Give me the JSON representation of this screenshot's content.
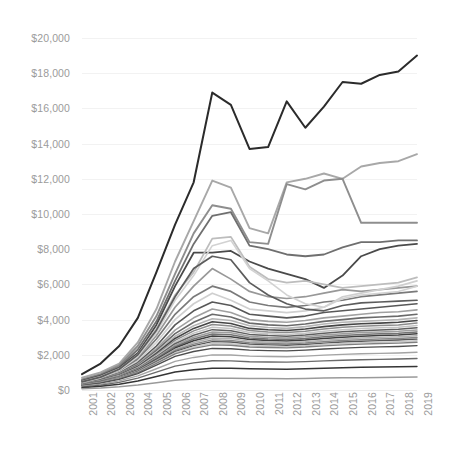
{
  "chart_data": {
    "type": "line",
    "title": "",
    "subtitle": "",
    "xlabel": "",
    "ylabel": "",
    "grid": true,
    "legend": "none",
    "x": [
      2001,
      2002,
      2003,
      2004,
      2005,
      2006,
      2007,
      2008,
      2009,
      2010,
      2011,
      2012,
      2013,
      2014,
      2015,
      2016,
      2017,
      2018,
      2019
    ],
    "x_tick_labels": [
      "2001",
      "2002",
      "2003",
      "2004",
      "2005",
      "2006",
      "2007",
      "2008",
      "2009",
      "2010",
      "2011",
      "2012",
      "2013",
      "2014",
      "2015",
      "2016",
      "2017",
      "2018",
      "2019"
    ],
    "y_tick_labels": [
      "$20,000",
      "$18,000",
      "$16,000",
      "$14,000",
      "$12,000",
      "$10,000",
      "$8,000",
      "$6,000",
      "$4,000",
      "$2,000",
      "$0"
    ],
    "y_tick_values": [
      20000,
      18000,
      16000,
      14000,
      12000,
      10000,
      8000,
      6000,
      4000,
      2000,
      0
    ],
    "ylim": [
      0,
      20000
    ],
    "xlim": [
      2001,
      2019
    ],
    "series": [
      {
        "name": "series-01",
        "color": "#2b2b2b",
        "width": 2.0,
        "values": [
          900,
          1500,
          2500,
          4100,
          6700,
          9400,
          11800,
          16900,
          16200,
          13700,
          13800,
          16400,
          14900,
          16100,
          17500,
          17400,
          17900,
          18100,
          19000
        ]
      },
      {
        "name": "series-02",
        "color": "#a8a8a8",
        "width": 1.9,
        "values": [
          700,
          1000,
          1500,
          2700,
          4600,
          7300,
          9600,
          11900,
          11500,
          9200,
          8900,
          11800,
          12000,
          12300,
          12000,
          12700,
          12900,
          13000,
          13400
        ]
      },
      {
        "name": "series-03",
        "color": "#8e8e8e",
        "width": 1.9,
        "values": [
          600,
          900,
          1400,
          2500,
          4200,
          6600,
          8900,
          10500,
          10300,
          8400,
          8300,
          11700,
          11400,
          11900,
          12000,
          9500,
          9500,
          9500,
          9500
        ]
      },
      {
        "name": "series-04",
        "color": "#6f6f6f",
        "width": 1.8,
        "values": [
          550,
          850,
          1300,
          2300,
          3900,
          6200,
          8300,
          9900,
          10100,
          8200,
          8000,
          7700,
          7600,
          7700,
          8100,
          8400,
          8400,
          8500,
          8500
        ]
      },
      {
        "name": "series-05",
        "color": "#4a4a4a",
        "width": 1.8,
        "values": [
          500,
          800,
          1250,
          2100,
          3700,
          5900,
          7800,
          7800,
          7900,
          7300,
          6900,
          6600,
          6300,
          5800,
          6500,
          7600,
          8000,
          8200,
          8300
        ]
      },
      {
        "name": "series-06",
        "color": "#bdbdbd",
        "width": 1.8,
        "values": [
          480,
          760,
          1200,
          2000,
          3500,
          5400,
          6700,
          8600,
          8700,
          7000,
          6300,
          6100,
          6200,
          6000,
          5800,
          5900,
          6000,
          6100,
          6400
        ]
      },
      {
        "name": "series-07",
        "color": "#989898",
        "width": 1.7,
        "values": [
          450,
          700,
          1100,
          1850,
          3100,
          4700,
          5900,
          6900,
          6300,
          5600,
          5300,
          5200,
          5300,
          5500,
          5700,
          5600,
          5700,
          5800,
          5900
        ]
      },
      {
        "name": "series-08",
        "color": "#7a7a7a",
        "width": 1.7,
        "values": [
          430,
          680,
          1050,
          1750,
          2900,
          4300,
          5300,
          5900,
          5600,
          5000,
          4800,
          4700,
          4800,
          5000,
          5100,
          5300,
          5400,
          5500,
          5600
        ]
      },
      {
        "name": "series-09",
        "color": "#cfcfcf",
        "width": 1.7,
        "values": [
          420,
          660,
          1000,
          1650,
          2700,
          4000,
          4900,
          5500,
          5100,
          4600,
          4500,
          4400,
          4500,
          4700,
          5300,
          5500,
          5700,
          5900,
          6200
        ]
      },
      {
        "name": "series-10",
        "color": "#585858",
        "width": 1.6,
        "values": [
          400,
          630,
          960,
          1550,
          2500,
          3700,
          4500,
          5000,
          4800,
          4300,
          4200,
          4100,
          4200,
          4400,
          4500,
          4600,
          4700,
          4800,
          4900
        ]
      },
      {
        "name": "series-11",
        "color": "#a0a0a0",
        "width": 1.6,
        "values": [
          390,
          610,
          930,
          1480,
          2350,
          3400,
          4100,
          4600,
          4400,
          4000,
          3900,
          3850,
          3950,
          4100,
          4200,
          4300,
          4400,
          4450,
          4550
        ]
      },
      {
        "name": "series-12",
        "color": "#6a6a6a",
        "width": 1.6,
        "values": [
          380,
          590,
          900,
          1420,
          2250,
          3200,
          3850,
          4300,
          4150,
          3800,
          3700,
          3650,
          3750,
          3900,
          4000,
          4100,
          4150,
          4200,
          4300
        ]
      },
      {
        "name": "series-13",
        "color": "#b5b5b5",
        "width": 1.6,
        "values": [
          370,
          570,
          870,
          1370,
          2150,
          3050,
          3650,
          4050,
          3950,
          3650,
          3550,
          3500,
          3600,
          3750,
          3850,
          3900,
          3950,
          4000,
          4100
        ]
      },
      {
        "name": "series-14",
        "color": "#454545",
        "width": 1.6,
        "values": [
          360,
          560,
          850,
          1330,
          2080,
          2930,
          3500,
          3880,
          3780,
          3500,
          3420,
          3380,
          3470,
          3600,
          3700,
          3760,
          3800,
          3850,
          3950
        ]
      },
      {
        "name": "series-15",
        "color": "#8c8c8c",
        "width": 1.5,
        "values": [
          350,
          545,
          825,
          1290,
          2010,
          2820,
          3360,
          3720,
          3640,
          3380,
          3300,
          3260,
          3340,
          3460,
          3560,
          3620,
          3660,
          3700,
          3800
        ]
      },
      {
        "name": "series-16",
        "color": "#c4c4c4",
        "width": 1.5,
        "values": [
          345,
          530,
          805,
          1255,
          1950,
          2720,
          3230,
          3570,
          3500,
          3270,
          3190,
          3150,
          3230,
          3340,
          3430,
          3490,
          3530,
          3570,
          3660
        ]
      },
      {
        "name": "series-17",
        "color": "#5f5f5f",
        "width": 1.5,
        "values": [
          335,
          515,
          785,
          1220,
          1890,
          2630,
          3110,
          3430,
          3370,
          3160,
          3090,
          3050,
          3120,
          3230,
          3310,
          3370,
          3410,
          3450,
          3530
        ]
      },
      {
        "name": "series-18",
        "color": "#9e9e9e",
        "width": 1.5,
        "values": [
          325,
          500,
          765,
          1185,
          1835,
          2540,
          3000,
          3300,
          3250,
          3060,
          2990,
          2955,
          3020,
          3120,
          3200,
          3260,
          3300,
          3340,
          3410
        ]
      },
      {
        "name": "series-19",
        "color": "#737373",
        "width": 1.5,
        "values": [
          315,
          487,
          745,
          1155,
          1780,
          2460,
          2895,
          3180,
          3135,
          2960,
          2900,
          2865,
          2925,
          3020,
          3095,
          3150,
          3190,
          3230,
          3300
        ]
      },
      {
        "name": "series-20",
        "color": "#3f3f3f",
        "width": 1.5,
        "values": [
          305,
          474,
          727,
          1125,
          1730,
          2385,
          2795,
          3065,
          3025,
          2865,
          2810,
          2780,
          2835,
          2925,
          2995,
          3050,
          3090,
          3125,
          3190
        ]
      },
      {
        "name": "series-21",
        "color": "#b0b0b0",
        "width": 1.4,
        "values": [
          298,
          462,
          709,
          1096,
          1682,
          2312,
          2700,
          2955,
          2920,
          2775,
          2725,
          2698,
          2750,
          2835,
          2900,
          2952,
          2990,
          3025,
          3085
        ]
      },
      {
        "name": "series-22",
        "color": "#868686",
        "width": 1.4,
        "values": [
          290,
          450,
          692,
          1069,
          1636,
          2243,
          2610,
          2850,
          2820,
          2688,
          2642,
          2618,
          2668,
          2748,
          2810,
          2860,
          2896,
          2930,
          2986
        ]
      },
      {
        "name": "series-23",
        "color": "#565656",
        "width": 1.4,
        "values": [
          282,
          439,
          676,
          1043,
          1592,
          2177,
          2524,
          2750,
          2724,
          2604,
          2562,
          2540,
          2588,
          2664,
          2724,
          2772,
          2806,
          2838,
          2892
        ]
      },
      {
        "name": "series-24",
        "color": "#c8c8c8",
        "width": 1.4,
        "values": [
          275,
          428,
          660,
          1018,
          1550,
          2114,
          2442,
          2654,
          2632,
          2524,
          2486,
          2466,
          2512,
          2584,
          2642,
          2688,
          2720,
          2750,
          2802
        ]
      },
      {
        "name": "series-25",
        "color": "#7f7f7f",
        "width": 1.4,
        "values": [
          268,
          418,
          645,
          994,
          1510,
          2054,
          2364,
          2562,
          2544,
          2447,
          2413,
          2395,
          2439,
          2508,
          2564,
          2608,
          2638,
          2666,
          2716
        ]
      },
      {
        "name": "series-26",
        "color": "#4e4e4e",
        "width": 1.4,
        "values": [
          248,
          390,
          604,
          932,
          1412,
          1910,
          2186,
          2362,
          2348,
          2266,
          2238,
          2224,
          2264,
          2328,
          2380,
          2420,
          2448,
          2474,
          2520
        ]
      },
      {
        "name": "series-27",
        "color": "#a4a4a4",
        "width": 1.4,
        "values": [
          210,
          332,
          518,
          800,
          1206,
          1624,
          1850,
          1994,
          1986,
          1924,
          1902,
          1892,
          1926,
          1980,
          2024,
          2058,
          2082,
          2104,
          2144
        ]
      },
      {
        "name": "series-28",
        "color": "#6b6b6b",
        "width": 1.4,
        "values": [
          175,
          278,
          436,
          676,
          1014,
          1358,
          1542,
          1658,
          1654,
          1606,
          1590,
          1582,
          1610,
          1654,
          1692,
          1720,
          1740,
          1758,
          1792
        ]
      },
      {
        "name": "series-29",
        "color": "#353535",
        "width": 1.5,
        "values": [
          130,
          208,
          328,
          512,
          766,
          1020,
          1154,
          1238,
          1236,
          1202,
          1190,
          1184,
          1206,
          1238,
          1266,
          1288,
          1304,
          1318,
          1342
        ]
      },
      {
        "name": "series-30",
        "color": "#9a9a9a",
        "width": 1.5,
        "values": [
          70,
          112,
          178,
          280,
          418,
          556,
          628,
          674,
          674,
          656,
          650,
          646,
          658,
          676,
          690,
          702,
          712,
          720,
          732
        ]
      },
      {
        "name": "series-31",
        "color": "#d2d2d2",
        "width": 1.6,
        "values": [
          430,
          690,
          1120,
          1900,
          3250,
          5100,
          6500,
          8200,
          8500,
          6900,
          6200,
          5400,
          4900,
          4700,
          5200,
          5400,
          5500,
          5600,
          5900
        ]
      },
      {
        "name": "series-32",
        "color": "#5c5c5c",
        "width": 1.7,
        "values": [
          460,
          730,
          1180,
          2000,
          3400,
          5300,
          6900,
          7600,
          7400,
          6100,
          5400,
          4900,
          4600,
          4500,
          4800,
          4950,
          5000,
          5050,
          5100
        ]
      }
    ]
  },
  "axis": {
    "y_label_color": "#9b9b9b",
    "x_label_color": "#9b9b9b",
    "gridline_color": "#f2f2f2"
  }
}
